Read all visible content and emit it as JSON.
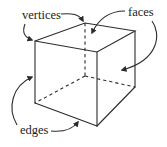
{
  "diagram": {
    "labels": {
      "vertices": "vertices",
      "faces": "faces",
      "edges": "edges"
    },
    "colors": {
      "line": "#2b2b2b",
      "text": "#222222",
      "background": "#ffffff"
    },
    "cube": {
      "vertices": {
        "front_top_left": [
          35,
          41
        ],
        "front_top_right": [
          97,
          52
        ],
        "front_bottom_left": [
          35,
          103
        ],
        "front_bottom_right": [
          97,
          126
        ],
        "back_top_left": [
          85,
          23
        ],
        "back_top_right": [
          135,
          31
        ],
        "back_bottom_left": [
          85,
          76
        ],
        "back_bottom_right": [
          135,
          87
        ]
      },
      "hidden_edges": [
        "back_top_left-back_bottom_left",
        "back_bottom_left-front_bottom_left",
        "back_bottom_left-back_bottom_right"
      ]
    },
    "annotations": [
      {
        "label": "vertices",
        "targets": [
          "front_top_left",
          "back_top_left"
        ]
      },
      {
        "label": "faces",
        "targets": [
          "top_face",
          "right_face"
        ]
      },
      {
        "label": "edges",
        "targets": [
          "front_left_edge",
          "front_bottom_edge"
        ]
      }
    ]
  }
}
